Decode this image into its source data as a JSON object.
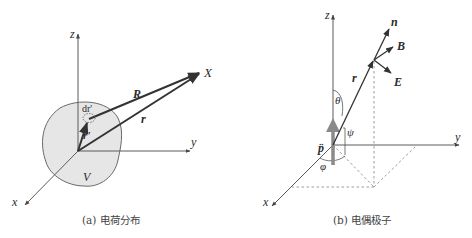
{
  "figure_a": {
    "caption": "(a) 电荷分布",
    "axes": {
      "z": "z",
      "y": "y",
      "x": "x"
    },
    "labels": {
      "point": "X",
      "R": "R",
      "r": "r",
      "r_prime": "r'",
      "dr_prime": "dr'",
      "volume": "V"
    },
    "colors": {
      "region_fill": "#e6e6e6",
      "vector": "#333333",
      "axis": "#5a5a5a"
    }
  },
  "figure_b": {
    "caption": "(b) 电偶极子",
    "axes": {
      "z": "z",
      "y": "y",
      "x": "x"
    },
    "labels": {
      "n": "n",
      "B": "B",
      "E": "E",
      "r": "r",
      "theta": "θ",
      "psi": "ψ",
      "phi": "φ",
      "dipole": "p̈"
    },
    "colors": {
      "dipole_arrow": "#8a8a8a",
      "vector": "#333333",
      "dashed": "#9a9a9a"
    }
  }
}
